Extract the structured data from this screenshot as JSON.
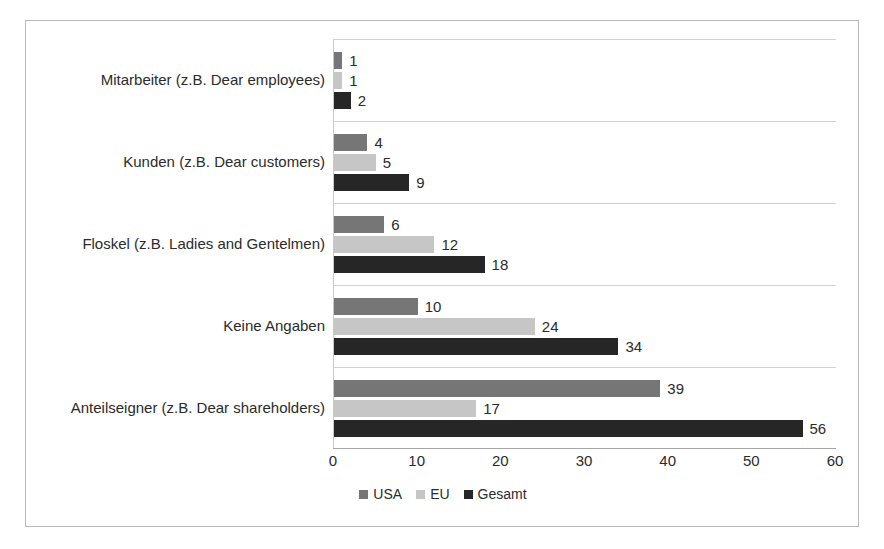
{
  "chart_data": {
    "type": "bar",
    "orientation": "horizontal",
    "title": "",
    "xlabel": "",
    "ylabel": "",
    "xlim": [
      0,
      60
    ],
    "xticks": [
      "0",
      "10",
      "20",
      "30",
      "40",
      "50",
      "60"
    ],
    "grid": true,
    "legend_position": "bottom",
    "categories": [
      "Mitarbeiter (z.B. Dear employees)",
      "Kunden (z.B. Dear customers)",
      "Floskel (z.B. Ladies and Gentelmen)",
      "Keine Angaben",
      "Anteilseigner (z.B. Dear shareholders)"
    ],
    "series": [
      {
        "name": "USA",
        "color": "#767676",
        "values": [
          1,
          4,
          6,
          10,
          39
        ]
      },
      {
        "name": "EU",
        "color": "#c6c6c6",
        "values": [
          1,
          5,
          12,
          24,
          17
        ]
      },
      {
        "name": "Gesamt",
        "color": "#262626",
        "values": [
          2,
          9,
          18,
          34,
          56
        ]
      }
    ],
    "data_labels": [
      [
        "1",
        "1",
        "2"
      ],
      [
        "4",
        "5",
        "9"
      ],
      [
        "6",
        "12",
        "18"
      ],
      [
        "10",
        "24",
        "34"
      ],
      [
        "39",
        "17",
        "56"
      ]
    ]
  },
  "legend": {
    "items": [
      {
        "label": "USA"
      },
      {
        "label": "EU"
      },
      {
        "label": "Gesamt"
      }
    ]
  }
}
